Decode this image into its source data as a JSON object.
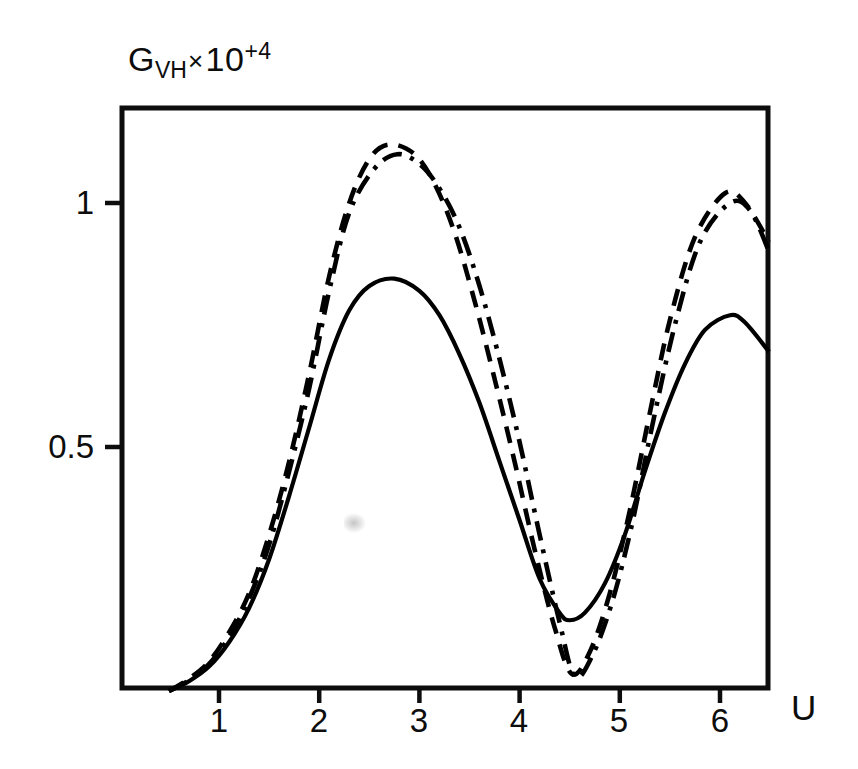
{
  "chart_data": {
    "type": "line",
    "title": "",
    "subtitle": "",
    "ylabel": "G_VH x 10^+4",
    "ylabel_parts": {
      "base": "G",
      "subscript": "VH",
      "times": "×",
      "mantissa": "10",
      "exponent": "+4"
    },
    "xlabel": "U",
    "grid": false,
    "legend": "none",
    "xlim": [
      0.03,
      6.49
    ],
    "ylim": [
      0.0,
      1.19
    ],
    "xticks": [
      1,
      2,
      3,
      4,
      5,
      6
    ],
    "xtick_labels": [
      "1",
      "2",
      "3",
      "4",
      "5",
      "6"
    ],
    "yticks": [
      0.5,
      1.0
    ],
    "ytick_labels": [
      "0.5",
      "1"
    ],
    "annotations": [],
    "series": [
      {
        "name": "solid-curve",
        "style": "solid",
        "color": "#000000",
        "peaks": [
          {
            "x": 2.75,
            "y": 0.845
          },
          {
            "x": 6.1,
            "y": 0.77
          }
        ],
        "valley": {
          "x": 4.5,
          "y": 0.145
        },
        "x": [
          0.5,
          0.7,
          0.9,
          1.1,
          1.3,
          1.5,
          1.7,
          1.9,
          2.1,
          2.3,
          2.5,
          2.75,
          3.0,
          3.2,
          3.4,
          3.6,
          3.8,
          4.0,
          4.2,
          4.4,
          4.5,
          4.65,
          4.85,
          5.05,
          5.25,
          5.45,
          5.65,
          5.85,
          6.1,
          6.25,
          6.49
        ],
        "y": [
          0.0,
          0.02,
          0.05,
          0.1,
          0.17,
          0.27,
          0.4,
          0.54,
          0.68,
          0.78,
          0.83,
          0.845,
          0.82,
          0.77,
          0.69,
          0.59,
          0.47,
          0.35,
          0.23,
          0.16,
          0.145,
          0.16,
          0.22,
          0.32,
          0.45,
          0.57,
          0.67,
          0.74,
          0.77,
          0.755,
          0.695
        ]
      },
      {
        "name": "dashed-curve",
        "style": "dashed",
        "color": "#000000",
        "peaks": [
          {
            "x": 2.7,
            "y": 1.12
          },
          {
            "x": 6.05,
            "y": 1.02
          }
        ],
        "valley": {
          "x": 4.52,
          "y": 0.035
        },
        "x": [
          0.5,
          0.7,
          0.9,
          1.1,
          1.3,
          1.5,
          1.7,
          1.9,
          2.1,
          2.3,
          2.5,
          2.7,
          2.95,
          3.15,
          3.35,
          3.55,
          3.75,
          3.95,
          4.15,
          4.35,
          4.52,
          4.7,
          4.9,
          5.1,
          5.3,
          5.5,
          5.75,
          6.05,
          6.25,
          6.49
        ],
        "y": [
          0.0,
          0.025,
          0.06,
          0.12,
          0.2,
          0.32,
          0.47,
          0.65,
          0.85,
          1.0,
          1.09,
          1.12,
          1.1,
          1.04,
          0.94,
          0.8,
          0.64,
          0.47,
          0.29,
          0.13,
          0.035,
          0.08,
          0.2,
          0.37,
          0.57,
          0.76,
          0.93,
          1.02,
          1.0,
          0.92
        ]
      },
      {
        "name": "dash-dot-curve",
        "style": "dash-dot",
        "color": "#000000",
        "peaks": [
          {
            "x": 2.78,
            "y": 1.1
          },
          {
            "x": 6.1,
            "y": 1.0
          }
        ],
        "valley": {
          "x": 4.55,
          "y": 0.03
        },
        "x": [
          0.5,
          0.7,
          0.9,
          1.1,
          1.3,
          1.5,
          1.7,
          1.9,
          2.1,
          2.3,
          2.55,
          2.78,
          3.0,
          3.2,
          3.4,
          3.6,
          3.8,
          4.0,
          4.2,
          4.4,
          4.55,
          4.72,
          4.92,
          5.12,
          5.32,
          5.55,
          5.8,
          6.1,
          6.3,
          6.49
        ],
        "y": [
          0.0,
          0.022,
          0.055,
          0.11,
          0.19,
          0.3,
          0.45,
          0.62,
          0.82,
          0.98,
          1.07,
          1.1,
          1.08,
          1.03,
          0.95,
          0.83,
          0.68,
          0.51,
          0.32,
          0.14,
          0.03,
          0.07,
          0.18,
          0.34,
          0.54,
          0.75,
          0.92,
          1.0,
          0.985,
          0.9
        ]
      }
    ]
  },
  "axes": {
    "frame": {
      "left": 122,
      "top": 108,
      "right": 768,
      "bottom": 688
    },
    "ylabel_text": "G",
    "ylabel_sub": "VH",
    "ylabel_times": "×",
    "ylabel_mantissa": "10",
    "ylabel_exponent": "+4",
    "xlabel_text": "U"
  }
}
